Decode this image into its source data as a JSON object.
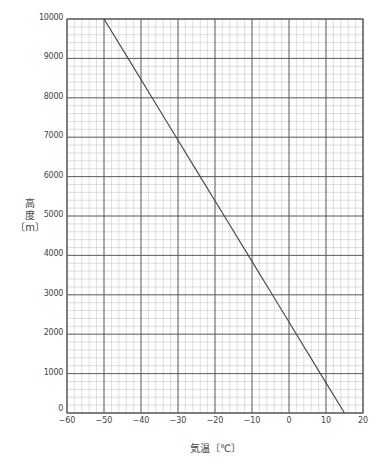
{
  "chart_data": {
    "type": "line",
    "title": "",
    "xlabel": "気温〔℃〕",
    "ylabel": "高度〔m〕",
    "ylabel_lines": [
      "高",
      "度",
      "〔m〕"
    ],
    "xlim": [
      -60,
      20
    ],
    "ylim": [
      0,
      10000
    ],
    "x_ticks": [
      -60,
      -50,
      -40,
      -30,
      -20,
      -10,
      0,
      10,
      20
    ],
    "x_tick_labels": [
      "−60",
      "−50",
      "−40",
      "−30",
      "−20",
      "−10",
      "0",
      "10",
      "20"
    ],
    "y_ticks": [
      0,
      1000,
      2000,
      3000,
      4000,
      5000,
      6000,
      7000,
      8000,
      9000,
      10000
    ],
    "y_tick_labels": [
      "0",
      "1000",
      "2000",
      "3000",
      "4000",
      "5000",
      "6000",
      "7000",
      "8000",
      "9000",
      "10000"
    ],
    "grid": {
      "major_x_step": 10,
      "minor_x_step": 2,
      "major_y_step": 1000,
      "minor_y_step": 200
    },
    "legend": null,
    "series": [
      {
        "name": "気温と高度",
        "x": [
          15,
          8.5,
          2,
          -4.5,
          -11,
          -17.5,
          -24,
          -30.5,
          -37,
          -43.5,
          -50
        ],
        "y": [
          0,
          1000,
          2000,
          3000,
          4000,
          5000,
          6000,
          7000,
          8000,
          9000,
          10000
        ]
      }
    ]
  },
  "colors": {
    "major_grid": "#555555",
    "minor_grid": "#c8c8c8",
    "line": "#444444",
    "text": "#444444"
  }
}
